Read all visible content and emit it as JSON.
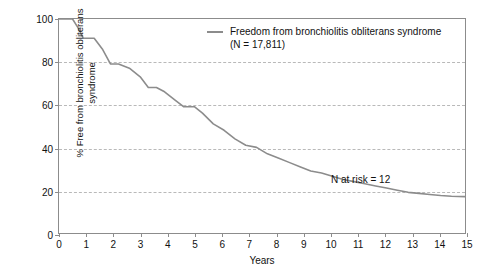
{
  "chart_data": {
    "type": "line",
    "title": "",
    "subtitle": "",
    "xlabel": "Years",
    "ylabel": "% Free from bronchiolitis obliterans syndrome",
    "ylabel_line1": "% Free from bronchiolitis obliterans",
    "ylabel_line2": "syndrome",
    "xlim": [
      0,
      15
    ],
    "ylim": [
      0,
      100
    ],
    "xticks": [
      0,
      1,
      2,
      3,
      4,
      5,
      6,
      7,
      8,
      9,
      10,
      11,
      12,
      13,
      14,
      15
    ],
    "yticks": [
      0,
      20,
      40,
      60,
      80,
      100
    ],
    "xtick_labels": [
      "0",
      "1",
      "2",
      "3",
      "4",
      "5",
      "6",
      "7",
      "8",
      "9",
      "10",
      "11",
      "12",
      "13",
      "14",
      "15"
    ],
    "ytick_labels": [
      "0",
      "20",
      "40",
      "60",
      "80",
      "100"
    ],
    "grid": true,
    "grid_axis": "y",
    "grid_values": [
      20,
      40,
      60,
      80
    ],
    "grid_style": "dashed",
    "grid_color": "#b9b9b9",
    "frame": true,
    "frame_color": "#8c8c8c",
    "legend_position": "top-right-inside",
    "line_color": "#8c8c8c",
    "series": [
      {
        "name": "Freedom from bronchiolitis obliterans syndrome",
        "n": "17,811",
        "color": "#8c8c8c",
        "step": true,
        "x": [
          0.0,
          0.5,
          0.7,
          0.9,
          1.3,
          1.6,
          1.9,
          2.2,
          2.6,
          3.0,
          3.3,
          3.6,
          3.9,
          4.3,
          4.6,
          5.0,
          5.3,
          5.7,
          6.1,
          6.5,
          6.9,
          7.3,
          7.7,
          8.1,
          8.5,
          8.9,
          9.3,
          9.7,
          10.1,
          10.5,
          10.9,
          11.3,
          11.7,
          12.1,
          12.5,
          12.9,
          13.3,
          13.7,
          14.1,
          14.5,
          15.0
        ],
        "y": [
          100.0,
          100.0,
          96.0,
          91.0,
          91.0,
          86.0,
          79.0,
          79.0,
          77.0,
          73.0,
          68.0,
          68.0,
          66.0,
          62.0,
          59.0,
          59.0,
          56.0,
          51.0,
          48.0,
          44.0,
          41.0,
          40.0,
          37.0,
          35.0,
          33.0,
          31.0,
          29.0,
          28.0,
          26.5,
          25.0,
          24.0,
          23.0,
          22.0,
          21.0,
          20.0,
          19.0,
          18.5,
          18.0,
          17.5,
          17.2,
          17.0
        ]
      }
    ],
    "annotations": [
      {
        "text": "N at risk = 12",
        "x": 10.0,
        "y": 25.0
      }
    ]
  },
  "legend": {
    "line1": "Freedom from bronchiolitis obliterans syndrome",
    "line2": "(N = 17,811)"
  },
  "annotation": {
    "n_at_risk": "N at risk = 12"
  }
}
